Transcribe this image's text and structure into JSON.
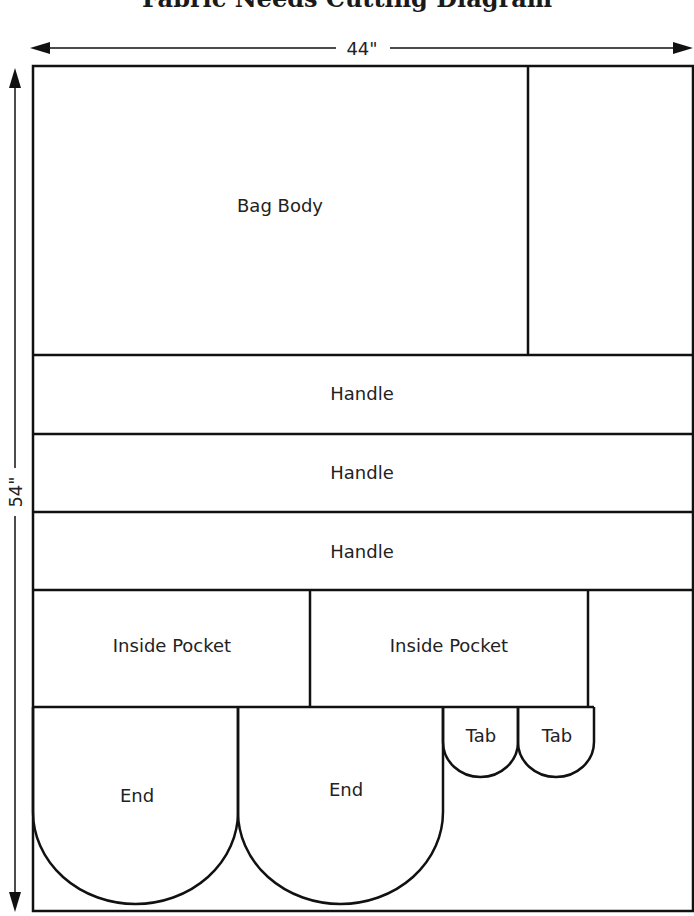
{
  "title": "Fabric Needs Cutting Diagram",
  "dimensions": {
    "width_label": "44\"",
    "height_label": "54\""
  },
  "pieces": {
    "bag_body": "Bag Body",
    "handle_1": "Handle",
    "handle_2": "Handle",
    "handle_3": "Handle",
    "inside_pocket_1": "Inside Pocket",
    "inside_pocket_2": "Inside Pocket",
    "end_1": "End",
    "end_2": "End",
    "tab_1": "Tab",
    "tab_2": "Tab"
  },
  "colors": {
    "line": "#111111",
    "text": "#222222",
    "background": "#ffffff"
  }
}
